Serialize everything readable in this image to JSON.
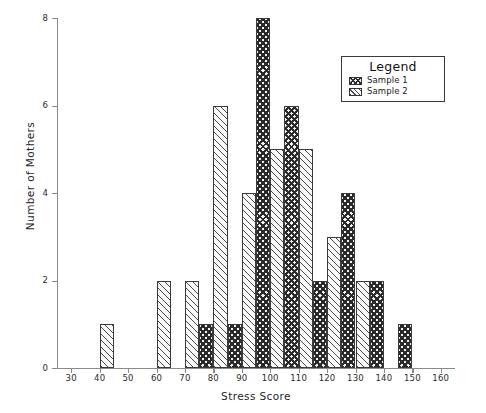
{
  "chart_data": {
    "type": "bar",
    "title": "",
    "xlabel": "Stress Score",
    "ylabel": "Number of Mothers",
    "xlim": [
      25,
      165
    ],
    "ylim": [
      0,
      8
    ],
    "xticks": [
      30,
      40,
      50,
      60,
      70,
      80,
      90,
      100,
      110,
      120,
      130,
      140,
      150,
      160
    ],
    "yticks": [
      0,
      2,
      4,
      6,
      8
    ],
    "grid": false,
    "legend_position": "upper right",
    "bin_width": 5,
    "series": [
      {
        "name": "Sample 1",
        "pattern": "cross-hatch",
        "bins": [
          {
            "start": 75,
            "end": 80,
            "value": 1
          },
          {
            "start": 85,
            "end": 90,
            "value": 1
          },
          {
            "start": 95,
            "end": 100,
            "value": 8
          },
          {
            "start": 105,
            "end": 110,
            "value": 6
          },
          {
            "start": 115,
            "end": 120,
            "value": 2
          },
          {
            "start": 125,
            "end": 130,
            "value": 4
          },
          {
            "start": 135,
            "end": 140,
            "value": 2
          },
          {
            "start": 145,
            "end": 150,
            "value": 1
          }
        ]
      },
      {
        "name": "Sample 2",
        "pattern": "diagonal-hatch",
        "bins": [
          {
            "start": 40,
            "end": 45,
            "value": 1
          },
          {
            "start": 60,
            "end": 65,
            "value": 2
          },
          {
            "start": 70,
            "end": 75,
            "value": 2
          },
          {
            "start": 80,
            "end": 85,
            "value": 6
          },
          {
            "start": 90,
            "end": 95,
            "value": 4
          },
          {
            "start": 100,
            "end": 105,
            "value": 5
          },
          {
            "start": 110,
            "end": 115,
            "value": 5
          },
          {
            "start": 120,
            "end": 125,
            "value": 3
          },
          {
            "start": 130,
            "end": 135,
            "value": 2
          }
        ]
      }
    ]
  },
  "legend": {
    "title": "Legend",
    "entries": [
      {
        "label": "Sample 1",
        "pattern": "cross-hatch"
      },
      {
        "label": "Sample 2",
        "pattern": "diagonal-hatch"
      }
    ]
  }
}
